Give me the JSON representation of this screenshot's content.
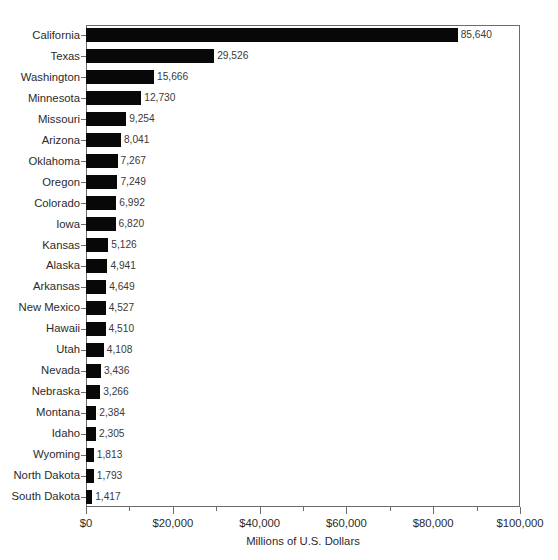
{
  "chart_data": {
    "type": "bar",
    "orientation": "horizontal",
    "title": "",
    "xlabel": "Millions of U.S. Dollars",
    "ylabel": "",
    "xlim": [
      0,
      100000
    ],
    "xticks": [
      0,
      20000,
      40000,
      60000,
      80000,
      100000
    ],
    "xtick_labels": [
      "$0",
      "$20,000",
      "$40,000",
      "$60,000",
      "$80,000",
      "$100,000"
    ],
    "xminor_ticks": [
      10000,
      30000,
      50000,
      70000,
      90000
    ],
    "grid": false,
    "legend": false,
    "bar_color": "#080808",
    "categories": [
      "California",
      "Texas",
      "Washington",
      "Minnesota",
      "Missouri",
      "Arizona",
      "Oklahoma",
      "Oregon",
      "Colorado",
      "Iowa",
      "Kansas",
      "Alaska",
      "Arkansas",
      "New Mexico",
      "Hawaii",
      "Utah",
      "Nevada",
      "Nebraska",
      "Montana",
      "Idaho",
      "Wyoming",
      "North Dakota",
      "South Dakota"
    ],
    "values": [
      85640,
      29526,
      15666,
      12730,
      9254,
      8041,
      7267,
      7249,
      6992,
      6820,
      5126,
      4941,
      4649,
      4527,
      4510,
      4108,
      3436,
      3266,
      2384,
      2305,
      1813,
      1793,
      1417
    ],
    "value_labels": [
      "85,640",
      "29,526",
      "15,666",
      "12,730",
      "9,254",
      "8,041",
      "7,267",
      "7,249",
      "6,992",
      "6,820",
      "5,126",
      "4,941",
      "4,649",
      "4,527",
      "4,510",
      "4,108",
      "3,436",
      "3,266",
      "2,384",
      "2,305",
      "1,813",
      "1,793",
      "1,417"
    ]
  }
}
